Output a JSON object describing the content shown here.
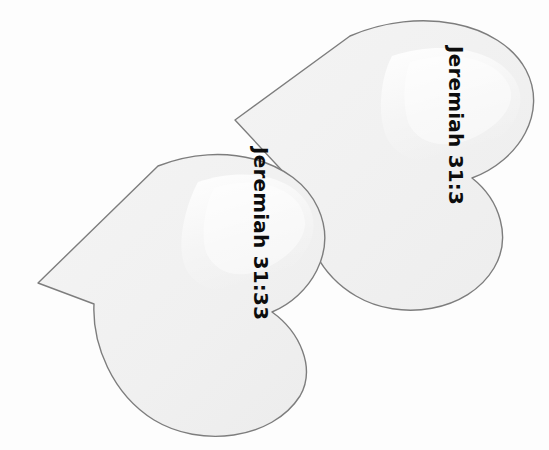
{
  "canvas": {
    "width": 549,
    "height": 450,
    "background_color": "#fdfdfd"
  },
  "style": {
    "shape_fill": "#f1f1f1",
    "shape_stroke": "#7d7d7d",
    "shape_highlight": "#fbfbfb",
    "label_color": "#0d0d0d"
  },
  "shapes": [
    {
      "id": "heart-upper-right",
      "name": "heart-shape-upper",
      "label": "Jeremiah 31:3",
      "rotation_degrees": 90,
      "fill": "#f1f1f1",
      "stroke": "#7d7d7d"
    },
    {
      "id": "heart-lower-left",
      "name": "heart-shape-lower",
      "label": "Jeremiah 31:33",
      "rotation_degrees": 90,
      "fill": "#f1f1f1",
      "stroke": "#7d7d7d"
    }
  ],
  "labels": {
    "upper": "Jeremiah 31:3",
    "lower": "Jeremiah 31:33"
  }
}
